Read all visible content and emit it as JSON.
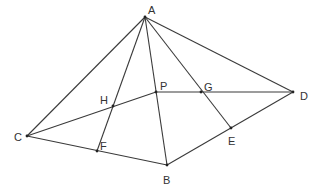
{
  "diagram": {
    "type": "geometry-figure",
    "points": {
      "A": {
        "label": "A",
        "x": 145,
        "y": 17,
        "lx": 148,
        "ly": 14
      },
      "B": {
        "label": "B",
        "x": 167,
        "y": 165,
        "lx": 163,
        "ly": 184
      },
      "C": {
        "label": "C",
        "x": 27,
        "y": 136,
        "lx": 14,
        "ly": 141
      },
      "D": {
        "label": "D",
        "x": 293,
        "y": 92,
        "lx": 300,
        "ly": 100
      },
      "E": {
        "label": "E",
        "x": 231,
        "y": 128,
        "lx": 228,
        "ly": 145
      },
      "F": {
        "label": "F",
        "x": 97,
        "y": 151,
        "lx": 100,
        "ly": 150
      },
      "G": {
        "label": "G",
        "x": 201,
        "y": 92,
        "lx": 204,
        "ly": 91
      },
      "H": {
        "label": "H",
        "x": 113,
        "y": 106,
        "lx": 100,
        "ly": 104
      },
      "P": {
        "label": "P",
        "x": 156,
        "y": 92,
        "lx": 160,
        "ly": 90
      }
    },
    "segments": [
      [
        "A",
        "C"
      ],
      [
        "A",
        "F"
      ],
      [
        "A",
        "B"
      ],
      [
        "A",
        "E"
      ],
      [
        "A",
        "D"
      ],
      [
        "C",
        "B"
      ],
      [
        "B",
        "D"
      ],
      [
        "C",
        "P"
      ],
      [
        "P",
        "D"
      ]
    ],
    "colors": {
      "line": "#3a3a3a",
      "label": "#333333",
      "background": "#ffffff"
    }
  }
}
